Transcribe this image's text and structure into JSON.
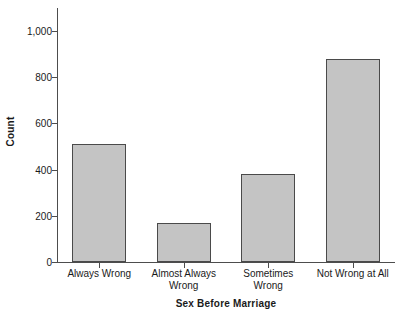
{
  "chart_data": {
    "type": "bar",
    "title": "",
    "xlabel": "Sex Before Marriage",
    "ylabel": "Count",
    "categories": [
      "Always Wrong",
      "Almost Always Wrong",
      "Sometimes Wrong",
      "Not Wrong at All"
    ],
    "category_lines": [
      [
        "Always Wrong"
      ],
      [
        "Almost Always",
        "Wrong"
      ],
      [
        "Sometimes",
        "Wrong"
      ],
      [
        "Not Wrong at All"
      ]
    ],
    "values": [
      510,
      170,
      380,
      880
    ],
    "ylim": [
      0,
      1100
    ],
    "yticks": [
      0,
      200,
      400,
      600,
      800,
      1000
    ],
    "ytick_labels": [
      "0",
      "200",
      "400",
      "600",
      "800",
      "1,000"
    ],
    "grid": false,
    "legend": false,
    "bar_fill_color": "#c4c4c4",
    "bar_border_color": "#4a4a4a",
    "axis_color": "#4d4d4d",
    "text_color": "#1a1a1a",
    "background_color": "#ffffff"
  }
}
